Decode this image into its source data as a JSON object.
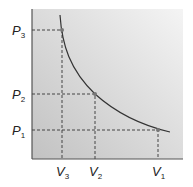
{
  "diagram": {
    "type": "pressure-volume isotherm",
    "y_labels": [
      {
        "var": "P",
        "sub": "3"
      },
      {
        "var": "P",
        "sub": "2"
      },
      {
        "var": "P",
        "sub": "1"
      }
    ],
    "x_labels": [
      {
        "var": "V",
        "sub": "3"
      },
      {
        "var": "V",
        "sub": "2"
      },
      {
        "var": "V",
        "sub": "1"
      }
    ],
    "points": [
      {
        "label": "P3,V3"
      },
      {
        "label": "P2,V2"
      },
      {
        "label": "P1,V1"
      }
    ],
    "colors": {
      "curve": "#333333",
      "point": "#777777",
      "bg_light": "#f2f2f2",
      "bg_dark": "#c4c4c4"
    }
  }
}
